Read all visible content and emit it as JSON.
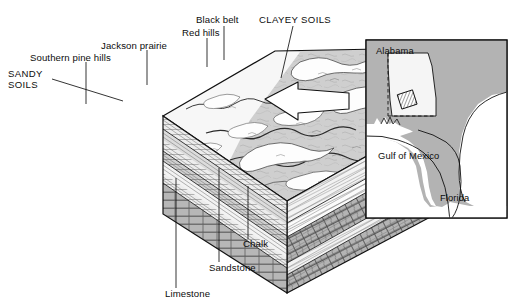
{
  "figure": {
    "type": "geologic-block-diagram",
    "title_present": false,
    "background_color": "#ffffff",
    "line_color": "#111111"
  },
  "block_labels": {
    "sandy_soils": "SANDY\nSOILS",
    "southern_pine_hills": "Southern pine hills",
    "jackson_prairie": "Jackson prairie",
    "red_hills": "Red hills",
    "black_belt": "Black belt",
    "clayey_soils": "CLAYEY SOILS",
    "limestone": "Limestone",
    "sandstone": "Sandstone",
    "chalk": "Chalk"
  },
  "inset_map": {
    "alabama": "Alabama",
    "gulf_of_mexico": "Gulf of Mexico",
    "florida": "Florida",
    "land_color": "#b3b3b3",
    "water_color": "#ffffff",
    "border_color": "#111111",
    "study_area_marker": "hatched-square"
  },
  "palette": {
    "upland_gray": "#c9c9c9",
    "light_gray": "#e2e2e2",
    "mid_gray": "#b0b0b0",
    "dark_gray": "#9a9a9a",
    "white": "#ffffff",
    "ink": "#111111"
  },
  "strata": [
    {
      "name": "Sandstone",
      "pattern": "diagonal-hatch",
      "fill": "#f2f2f2"
    },
    {
      "name": "Limestone",
      "pattern": "brick",
      "fill": "#b4b4b4"
    },
    {
      "name": "Chalk",
      "pattern": "fine-diagonal-lines",
      "fill": "#fafafa"
    }
  ]
}
